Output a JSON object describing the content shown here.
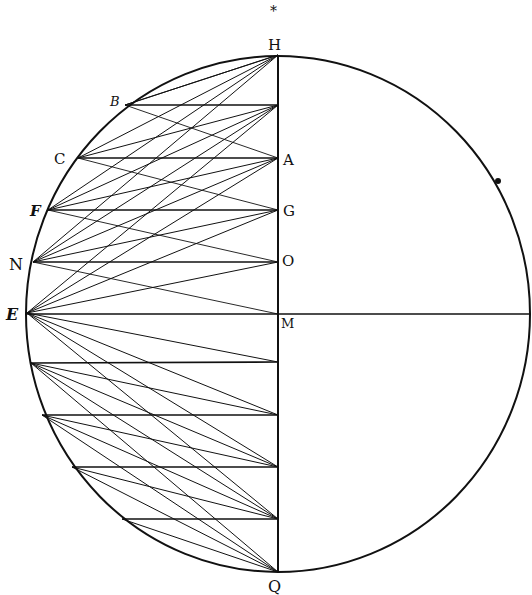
{
  "diagram": {
    "type": "geometric-construction",
    "stroke_color": "#111111",
    "background": "#ffffff",
    "circle": {
      "cx": 278,
      "cy": 314,
      "rx": 252,
      "ry": 258
    },
    "vertical_diameter": {
      "x": 278,
      "y1": 55,
      "y2": 572
    },
    "horizontal_radius": {
      "y": 314,
      "x1": 27,
      "x2": 530
    },
    "arc_points": [
      {
        "label": "B",
        "x": 125,
        "y": 105
      },
      {
        "label": "C",
        "x": 78,
        "y": 158
      },
      {
        "label": "F",
        "x": 48,
        "y": 210
      },
      {
        "label": "N",
        "x": 33,
        "y": 262
      },
      {
        "label": "E",
        "x": 27,
        "y": 313
      },
      {
        "label": "",
        "x": 31,
        "y": 363
      },
      {
        "label": "",
        "x": 42,
        "y": 415
      },
      {
        "label": "",
        "x": 72,
        "y": 467
      },
      {
        "label": "",
        "x": 122,
        "y": 519
      }
    ],
    "axis_points": [
      {
        "label": "H",
        "x": 278,
        "y": 55
      },
      {
        "label": "",
        "x": 278,
        "y": 105
      },
      {
        "label": "A",
        "x": 278,
        "y": 158
      },
      {
        "label": "G",
        "x": 278,
        "y": 210
      },
      {
        "label": "O",
        "x": 278,
        "y": 262
      },
      {
        "label": "M",
        "x": 278,
        "y": 314
      },
      {
        "label": "",
        "x": 278,
        "y": 362
      },
      {
        "label": "",
        "x": 278,
        "y": 415
      },
      {
        "label": "",
        "x": 278,
        "y": 467
      },
      {
        "label": "",
        "x": 278,
        "y": 519
      },
      {
        "label": "Q",
        "x": 278,
        "y": 572
      }
    ],
    "labels": {
      "H": "H",
      "B": "B",
      "C": "C",
      "A": "A",
      "F": "F",
      "G": "G",
      "N": "N",
      "O": "O",
      "E": "E",
      "M": "M",
      "Q": "Q"
    },
    "top_mark": "*"
  }
}
